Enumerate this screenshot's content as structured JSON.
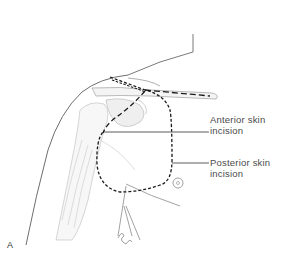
{
  "figure": {
    "panel_letter": "A",
    "labels": {
      "anterior": {
        "line1": "Anterior skin",
        "line2": "incision"
      },
      "posterior": {
        "line1": "Posterior skin",
        "line2": "incision"
      }
    },
    "colors": {
      "outline": "#6e6e6e",
      "incision": "#1a1a1a",
      "shading": "#c8c8c8",
      "label_text": "#4a4a4a"
    }
  }
}
